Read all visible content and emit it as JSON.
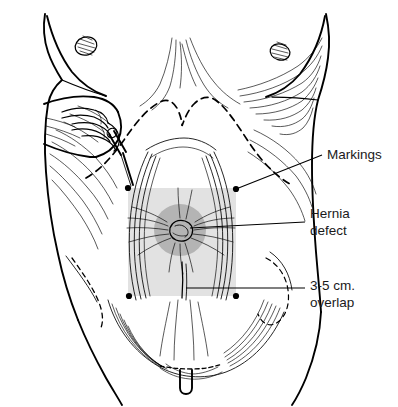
{
  "figure": {
    "background_color": "#ffffff",
    "ink_color": "#000000"
  },
  "overlays": {
    "mesh_rectangle": {
      "name": "mesh-overlap-area",
      "fill": "#e2e2e2",
      "x": 128,
      "y": 188,
      "width": 108,
      "height": 108
    },
    "hernia_circle": {
      "name": "hernia-defect-area",
      "fill": "#b4b4b4",
      "cx": 180,
      "cy": 230,
      "r": 26
    }
  },
  "marking_dots": [
    {
      "name": "corner-dot-top-left",
      "cx": 128,
      "cy": 188
    },
    {
      "name": "corner-dot-top-right",
      "cx": 236,
      "cy": 189
    },
    {
      "name": "corner-dot-bottom-left",
      "cx": 129,
      "cy": 296
    },
    {
      "name": "corner-dot-bottom-right",
      "cx": 236,
      "cy": 296
    }
  ],
  "labels": {
    "markings": {
      "text": "Markings",
      "x": 327,
      "y": 159
    },
    "hernia_defect": {
      "line1": "Hernia",
      "line2": "defect",
      "x": 310,
      "y": 218
    },
    "overlap": {
      "line1": "3-5 cm.",
      "line2": "overlap",
      "x": 310,
      "y": 290
    }
  },
  "annotations": {
    "marking_pen": "surgeon hand holding skin marking pen",
    "dashed_line": "dashed costal-margin skin marking",
    "umbilicus": "umbilicus at center of hernia defect"
  }
}
